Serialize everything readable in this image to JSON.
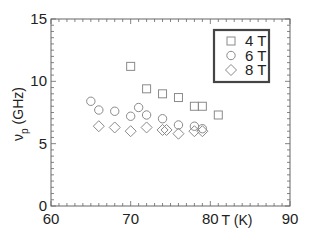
{
  "chart_data": {
    "type": "scatter",
    "title": "",
    "xlabel": "T (K)",
    "ylabel": "ν_p (GHz)",
    "ylabel_main": "ν",
    "ylabel_sub": "p",
    "ylabel_units": "(GHz)",
    "xlim": [
      60,
      90
    ],
    "ylim": [
      0,
      15
    ],
    "xticks": [
      60,
      70,
      80,
      90
    ],
    "yticks": [
      0,
      5,
      10,
      15
    ],
    "x_minor_step": 1,
    "y_minor_step": 0.5,
    "grid": false,
    "legend_position": "upper right",
    "series": [
      {
        "name": "4 T",
        "marker": "square",
        "points": [
          [
            70,
            11.2
          ],
          [
            72,
            9.4
          ],
          [
            74,
            9.0
          ],
          [
            76,
            8.7
          ],
          [
            78,
            8.0
          ],
          [
            79,
            8.0
          ],
          [
            81,
            7.3
          ]
        ]
      },
      {
        "name": "6 T",
        "marker": "circle",
        "points": [
          [
            65,
            8.4
          ],
          [
            66,
            7.7
          ],
          [
            68,
            7.6
          ],
          [
            70,
            7.2
          ],
          [
            71,
            7.9
          ],
          [
            72,
            7.3
          ],
          [
            74,
            7.0
          ],
          [
            76,
            6.5
          ],
          [
            78,
            6.4
          ],
          [
            79,
            6.2
          ]
        ]
      },
      {
        "name": "8 T",
        "marker": "diamond",
        "points": [
          [
            66,
            6.4
          ],
          [
            68,
            6.3
          ],
          [
            70,
            6.0
          ],
          [
            72,
            6.3
          ],
          [
            74,
            6.1
          ],
          [
            74.5,
            6.1
          ],
          [
            76,
            5.8
          ],
          [
            78,
            6.0
          ],
          [
            79,
            6.0
          ]
        ]
      }
    ]
  },
  "colors": {
    "marker": "#8a8a8a",
    "axis": "#666666",
    "legend_border": "#444444",
    "text": "#222222"
  }
}
